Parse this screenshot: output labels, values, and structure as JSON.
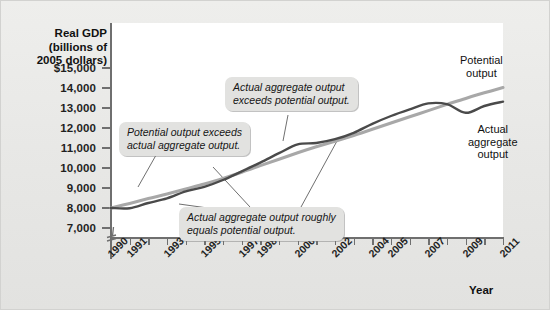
{
  "figure": {
    "y_axis_title": "Real GDP\n(billions of\n2005 dollars)",
    "y_axis_title_lines": [
      "Real GDP",
      "(billions of",
      "2005 dollars)"
    ],
    "x_axis_title": "Year"
  },
  "annotations": {
    "potential_exceeds": "Potential output exceeds\nactual aggregate output.",
    "potential_exceeds_lines": [
      "Potential output exceeds",
      "actual aggregate output."
    ],
    "actual_exceeds": "Actual aggregate output\nexceeds potential output.",
    "actual_exceeds_lines": [
      "Actual aggregate output",
      "exceeds potential output."
    ],
    "roughly_equals": "Actual aggregate output roughly\nequals potential output.",
    "roughly_equals_lines": [
      "Actual aggregate output roughly",
      "equals potential output."
    ],
    "potential_label_lines": [
      "Potential",
      "output"
    ],
    "actual_label_lines": [
      "Actual",
      "aggregate",
      "output"
    ]
  },
  "colors": {
    "potential_line": "#a8a8a8",
    "actual_line": "#4a4a4a",
    "plot_background": "#ffffff",
    "page_background": "#e9e9e7",
    "callout_background": "#e2e2e0",
    "axis": "#6f6f6f"
  },
  "chart_data": {
    "type": "line",
    "title": "",
    "xlabel": "Year",
    "ylabel": "Real GDP (billions of 2005 dollars)",
    "xlim": [
      1990,
      2011
    ],
    "ylim": [
      7000,
      15000
    ],
    "y_tick_labels": [
      "$15,000",
      "14,000",
      "13,000",
      "12,000",
      "11,000",
      "10,000",
      "9,000",
      "8,000",
      "7,000"
    ],
    "y_ticks": [
      15000,
      14000,
      13000,
      12000,
      11000,
      10000,
      9000,
      8000,
      7000
    ],
    "axis_break_below": 7000,
    "grid": false,
    "legend": "inline-labels",
    "x_tick_labels": [
      "1990",
      "1991",
      "1993",
      "1995",
      "1997",
      "1998",
      "2000",
      "2002",
      "2004",
      "2005",
      "2007",
      "2009",
      "2011"
    ],
    "x_tick_values": [
      1990,
      1991,
      1993,
      1995,
      1997,
      1998,
      2000,
      2002,
      2004,
      2005,
      2007,
      2009,
      2011
    ],
    "x_all_tick_values": [
      1990,
      1991,
      1992,
      1993,
      1994,
      1995,
      1996,
      1997,
      1998,
      1999,
      2000,
      2001,
      2002,
      2003,
      2004,
      2005,
      2006,
      2007,
      2008,
      2009,
      2010,
      2011
    ],
    "x": [
      1990,
      1991,
      1992,
      1993,
      1994,
      1995,
      1996,
      1997,
      1998,
      1999,
      2000,
      2001,
      2002,
      2003,
      2004,
      2005,
      2006,
      2007,
      2008,
      2009,
      2010,
      2011
    ],
    "series": [
      {
        "name": "Potential output",
        "color": "#a8a8a8",
        "values": [
          8000,
          8230,
          8470,
          8700,
          8950,
          9200,
          9480,
          9790,
          10120,
          10440,
          10760,
          11060,
          11340,
          11630,
          11940,
          12250,
          12560,
          12870,
          13180,
          13480,
          13760,
          14020
        ]
      },
      {
        "name": "Actual aggregate output",
        "color": "#4a4a4a",
        "values": [
          8000,
          7990,
          8250,
          8480,
          8830,
          9060,
          9400,
          9830,
          10270,
          10740,
          11180,
          11250,
          11440,
          11760,
          12210,
          12600,
          12930,
          13230,
          13190,
          12760,
          13100,
          13320
        ]
      }
    ],
    "notes": [
      "Potential output exceeds actual aggregate output.",
      "Actual aggregate output exceeds potential output.",
      "Actual aggregate output roughly equals potential output."
    ]
  }
}
